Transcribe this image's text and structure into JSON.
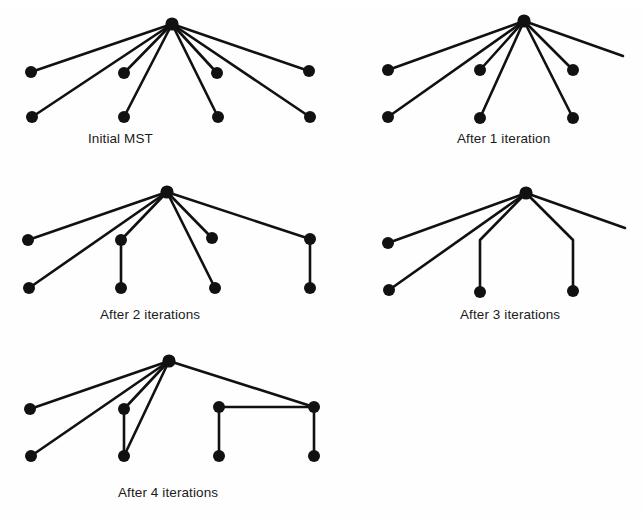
{
  "figure": {
    "title_visible": false,
    "background_color": "#fefefe",
    "ink_color": "#111111",
    "node_radius": 6,
    "edge_width": 2.6,
    "width": 643,
    "height": 518
  },
  "panels": [
    {
      "id": "initial-mst",
      "caption": "Initial MST",
      "caption_x": 88,
      "caption_y": 131,
      "origin_x": 0,
      "origin_y": 0,
      "width": 340,
      "height": 128,
      "hub": {
        "x": 172,
        "y": 24
      },
      "nodes": [
        {
          "name": "node-left-upper",
          "x": 31,
          "y": 72
        },
        {
          "name": "node-left-lower",
          "x": 32,
          "y": 117
        },
        {
          "name": "node-midleft-upper",
          "x": 124,
          "y": 73
        },
        {
          "name": "node-midleft-lower",
          "x": 124,
          "y": 117
        },
        {
          "name": "node-midright-upper",
          "x": 217,
          "y": 73
        },
        {
          "name": "node-midright-lower",
          "x": 218,
          "y": 117
        },
        {
          "name": "node-right-upper",
          "x": 309,
          "y": 71
        },
        {
          "name": "node-right-lower",
          "x": 310,
          "y": 117
        }
      ],
      "edges": [
        {
          "name": "edge-hub-left-upper",
          "points": [
            [
              172,
              24
            ],
            [
              31,
              72
            ]
          ]
        },
        {
          "name": "edge-hub-left-lower",
          "points": [
            [
              172,
              24
            ],
            [
              32,
              117
            ]
          ]
        },
        {
          "name": "edge-hub-midleft-upper",
          "points": [
            [
              172,
              24
            ],
            [
              124,
              73
            ]
          ]
        },
        {
          "name": "edge-hub-midleft-lower",
          "points": [
            [
              172,
              24
            ],
            [
              124,
              117
            ]
          ]
        },
        {
          "name": "edge-hub-midright-upper",
          "points": [
            [
              172,
              24
            ],
            [
              217,
              73
            ]
          ]
        },
        {
          "name": "edge-hub-midright-lower",
          "points": [
            [
              172,
              24
            ],
            [
              218,
              117
            ]
          ]
        },
        {
          "name": "edge-hub-right-upper",
          "points": [
            [
              172,
              24
            ],
            [
              309,
              71
            ]
          ]
        },
        {
          "name": "edge-hub-right-lower",
          "points": [
            [
              172,
              24
            ],
            [
              310,
              117
            ]
          ]
        }
      ]
    },
    {
      "id": "after-1-iteration",
      "caption": "After 1 iteration",
      "caption_x": 457,
      "caption_y": 131,
      "origin_x": 340,
      "origin_y": 0,
      "width": 303,
      "height": 128,
      "hub": {
        "x": 184,
        "y": 21
      },
      "nodes": [
        {
          "name": "node-left-upper",
          "x": 48,
          "y": 70
        },
        {
          "name": "node-left-lower",
          "x": 48,
          "y": 117
        },
        {
          "name": "node-mid-upper",
          "x": 140,
          "y": 70
        },
        {
          "name": "node-mid-lower",
          "x": 140,
          "y": 118
        },
        {
          "name": "node-right-upper",
          "x": 233,
          "y": 70
        },
        {
          "name": "node-right-lower",
          "x": 233,
          "y": 118
        }
      ],
      "edges": [
        {
          "name": "edge-hub-left-upper",
          "points": [
            [
              184,
              21
            ],
            [
              48,
              70
            ]
          ]
        },
        {
          "name": "edge-hub-left-lower",
          "points": [
            [
              184,
              21
            ],
            [
              48,
              117
            ]
          ]
        },
        {
          "name": "edge-hub-mid-upper",
          "points": [
            [
              184,
              21
            ],
            [
              140,
              70
            ]
          ]
        },
        {
          "name": "edge-hub-mid-lower",
          "points": [
            [
              184,
              21
            ],
            [
              140,
              118
            ]
          ]
        },
        {
          "name": "edge-hub-right-upper",
          "points": [
            [
              184,
              21
            ],
            [
              233,
              70
            ]
          ]
        },
        {
          "name": "edge-hub-right-lower",
          "points": [
            [
              184,
              21
            ],
            [
              233,
              118
            ]
          ]
        },
        {
          "name": "edge-hub-truncated-right",
          "points": [
            [
              184,
              21
            ],
            [
              283,
              56
            ]
          ]
        }
      ]
    },
    {
      "id": "after-2-iterations",
      "caption": "After 2 iterations",
      "caption_x": 100,
      "caption_y": 307,
      "origin_x": 0,
      "origin_y": 170,
      "width": 340,
      "height": 128,
      "hub": {
        "x": 167,
        "y": 22
      },
      "nodes": [
        {
          "name": "node-left-upper",
          "x": 28,
          "y": 70
        },
        {
          "name": "node-left-lower",
          "x": 29,
          "y": 118
        },
        {
          "name": "node-midleft-upper",
          "x": 121,
          "y": 70
        },
        {
          "name": "node-midleft-lower",
          "x": 121,
          "y": 118
        },
        {
          "name": "node-midright-upper",
          "x": 212,
          "y": 68
        },
        {
          "name": "node-midright-lower",
          "x": 215,
          "y": 118
        },
        {
          "name": "node-right-upper",
          "x": 310,
          "y": 69
        },
        {
          "name": "node-right-lower",
          "x": 310,
          "y": 118
        }
      ],
      "edges": [
        {
          "name": "edge-hub-left-upper",
          "points": [
            [
              167,
              22
            ],
            [
              28,
              70
            ]
          ]
        },
        {
          "name": "edge-hub-left-lower",
          "points": [
            [
              167,
              22
            ],
            [
              29,
              118
            ]
          ]
        },
        {
          "name": "edge-hub-midleft-upper",
          "points": [
            [
              167,
              22
            ],
            [
              121,
              70
            ]
          ]
        },
        {
          "name": "edge-hub-midright-upper",
          "points": [
            [
              167,
              22
            ],
            [
              212,
              68
            ]
          ]
        },
        {
          "name": "edge-hub-midright-lower",
          "points": [
            [
              167,
              22
            ],
            [
              215,
              118
            ]
          ]
        },
        {
          "name": "edge-hub-right-upper",
          "points": [
            [
              167,
              22
            ],
            [
              310,
              69
            ]
          ]
        },
        {
          "name": "edge-vertical-midleft",
          "points": [
            [
              121,
              70
            ],
            [
              121,
              118
            ]
          ]
        },
        {
          "name": "edge-vertical-right",
          "points": [
            [
              310,
              69
            ],
            [
              310,
              118
            ]
          ]
        }
      ]
    },
    {
      "id": "after-3-iterations",
      "caption": "After 3 iterations",
      "caption_x": 460,
      "caption_y": 307,
      "origin_x": 340,
      "origin_y": 170,
      "width": 303,
      "height": 128,
      "hub": {
        "x": 186,
        "y": 23
      },
      "nodes": [
        {
          "name": "node-left-upper",
          "x": 48,
          "y": 73
        },
        {
          "name": "node-left-lower",
          "x": 49,
          "y": 120
        },
        {
          "name": "node-mid-lower",
          "x": 140,
          "y": 122
        },
        {
          "name": "node-right-lower",
          "x": 233,
          "y": 121
        }
      ],
      "edges": [
        {
          "name": "edge-hub-left-upper",
          "points": [
            [
              186,
              23
            ],
            [
              48,
              73
            ]
          ]
        },
        {
          "name": "edge-hub-left-lower",
          "points": [
            [
              186,
              23
            ],
            [
              49,
              120
            ]
          ]
        },
        {
          "name": "edge-hub-mid-bent",
          "points": [
            [
              186,
              23
            ],
            [
              140,
              70
            ],
            [
              140,
              122
            ]
          ]
        },
        {
          "name": "edge-hub-right-bent",
          "points": [
            [
              186,
              23
            ],
            [
              233,
              70
            ],
            [
              233,
              121
            ]
          ]
        },
        {
          "name": "edge-hub-truncated-right",
          "points": [
            [
              186,
              23
            ],
            [
              285,
              58
            ]
          ]
        }
      ]
    },
    {
      "id": "after-4-iterations",
      "caption": "After 4 iterations",
      "caption_x": 118,
      "caption_y": 485,
      "origin_x": 0,
      "origin_y": 340,
      "width": 360,
      "height": 130,
      "hub": {
        "x": 169,
        "y": 21
      },
      "nodes": [
        {
          "name": "node-left-upper",
          "x": 30,
          "y": 69
        },
        {
          "name": "node-left-lower",
          "x": 31,
          "y": 116
        },
        {
          "name": "node-midleft-upper",
          "x": 124,
          "y": 69
        },
        {
          "name": "node-midleft-lower",
          "x": 124,
          "y": 116
        },
        {
          "name": "node-box-left-upper",
          "x": 219,
          "y": 67
        },
        {
          "name": "node-box-left-lower",
          "x": 219,
          "y": 116
        },
        {
          "name": "node-box-right-upper",
          "x": 314,
          "y": 67
        },
        {
          "name": "node-box-right-lower",
          "x": 314,
          "y": 116
        }
      ],
      "edges": [
        {
          "name": "edge-hub-left-upper",
          "points": [
            [
              169,
              21
            ],
            [
              30,
              69
            ]
          ]
        },
        {
          "name": "edge-hub-left-lower",
          "points": [
            [
              169,
              21
            ],
            [
              31,
              116
            ]
          ]
        },
        {
          "name": "edge-hub-midleft-upper",
          "points": [
            [
              169,
              21
            ],
            [
              124,
              69
            ]
          ]
        },
        {
          "name": "edge-hub-midleft-lower",
          "points": [
            [
              169,
              21
            ],
            [
              124,
              116
            ]
          ]
        },
        {
          "name": "edge-vertical-midleft",
          "points": [
            [
              124,
              69
            ],
            [
              124,
              116
            ]
          ]
        },
        {
          "name": "edge-hub-box-right-upper",
          "points": [
            [
              169,
              21
            ],
            [
              314,
              67
            ]
          ]
        },
        {
          "name": "edge-box-horizontal",
          "points": [
            [
              219,
              67
            ],
            [
              314,
              67
            ]
          ]
        },
        {
          "name": "edge-vertical-box-left",
          "points": [
            [
              219,
              67
            ],
            [
              219,
              116
            ]
          ]
        },
        {
          "name": "edge-vertical-box-right",
          "points": [
            [
              314,
              67
            ],
            [
              314,
              116
            ]
          ]
        }
      ]
    }
  ]
}
